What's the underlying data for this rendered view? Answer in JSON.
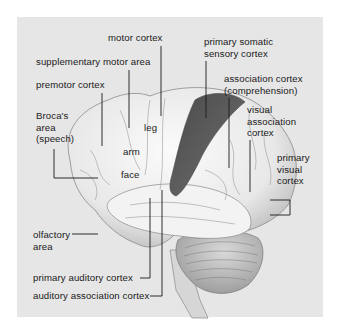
{
  "figure": {
    "colors": {
      "panel_background": "#e6e6e6",
      "motor_cortex_highlight": "#585858",
      "brain_tissue": "#f0f0f0",
      "leader_lines": "#1a1a1a"
    }
  },
  "labels": {
    "motor_cortex": "motor cortex",
    "supplementary_motor_area": "supplementary motor area",
    "premotor_cortex": "premotor cortex",
    "brocas_area": "Broca's\narea\n(speech)",
    "leg": "leg",
    "arm": "arm",
    "face": "face",
    "primary_somatic_sensory_cortex": "primary somatic\nsensory cortex",
    "association_cortex": "association cortex\n(comprehension)",
    "visual_association_cortex": "visual\nassociation\ncortex",
    "primary_visual_cortex": "primary\nvisual\ncortex",
    "olfactory_area": "olfactory\narea",
    "primary_auditory_cortex": "primary auditory cortex",
    "auditory_association_cortex": "auditory association cortex"
  }
}
